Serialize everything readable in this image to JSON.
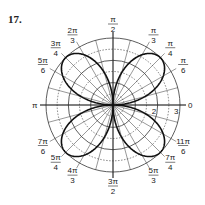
{
  "problem_number": "17.",
  "graph": {
    "type": "polar",
    "curve": "four-leaved rose",
    "petal_angles": [
      "π/4",
      "3π/4",
      "5π/4",
      "7π/4"
    ],
    "max_radius": 3,
    "radial_labels": [
      "1",
      "2",
      "3"
    ],
    "zero_label": "0",
    "pi_label": "π",
    "angle_labels": [
      {
        "num": "π",
        "den": "2"
      },
      {
        "num": "π",
        "den": "3"
      },
      {
        "num": "π",
        "den": "4"
      },
      {
        "num": "π",
        "den": "6"
      },
      {
        "num": "2π",
        "den": "3"
      },
      {
        "num": "3π",
        "den": "4"
      },
      {
        "num": "5π",
        "den": "6"
      },
      {
        "num": "7π",
        "den": "6"
      },
      {
        "num": "5π",
        "den": "4"
      },
      {
        "num": "4π",
        "den": "3"
      },
      {
        "num": "3π",
        "den": "2"
      },
      {
        "num": "5π",
        "den": "3"
      },
      {
        "num": "7π",
        "den": "4"
      },
      {
        "num": "11π",
        "den": "6"
      }
    ]
  }
}
